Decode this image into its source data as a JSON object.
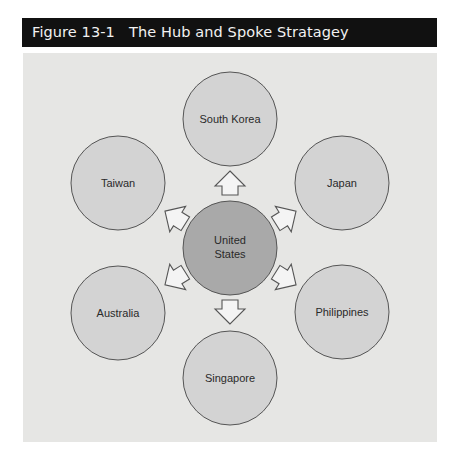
{
  "figure": {
    "title": "Figure 13-1   The Hub and Spoke Stratagey"
  },
  "colors": {
    "title_bar_bg": "#111111",
    "panel_bg": "#e6e6e4",
    "spoke_fill": "#d3d3d3",
    "hub_fill": "#a9a9a9",
    "stroke": "#555555",
    "arrow_fill": "#f4f4f4"
  },
  "diagram": {
    "hub": {
      "label_line1": "United",
      "label_line2": "States"
    },
    "spokes": [
      {
        "label": "South Korea",
        "position": "top"
      },
      {
        "label": "Japan",
        "position": "upper-right"
      },
      {
        "label": "Philippines",
        "position": "lower-right"
      },
      {
        "label": "Singapore",
        "position": "bottom"
      },
      {
        "label": "Australia",
        "position": "lower-left"
      },
      {
        "label": "Taiwan",
        "position": "upper-left"
      }
    ],
    "arrow_direction": "outward from hub to each spoke"
  }
}
